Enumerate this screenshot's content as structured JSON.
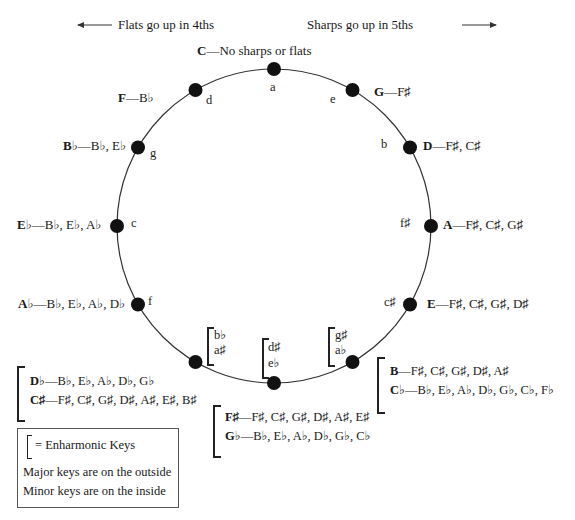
{
  "header": {
    "flats_direction": "Flats go up in 4ths",
    "sharps_direction": "Sharps go up in 5ths"
  },
  "circle": {
    "center": [
      274,
      226
    ],
    "radius": 157,
    "dot_color": "#111111",
    "line_color": "#333333"
  },
  "keys": [
    {
      "angle": 0,
      "major": "C",
      "signature": "No sharps or flats",
      "minor": "a"
    },
    {
      "angle": 30,
      "major": "G",
      "signature": "F♯",
      "minor": "e"
    },
    {
      "angle": 60,
      "major": "D",
      "signature": "F♯, C♯",
      "minor": "b"
    },
    {
      "angle": 90,
      "major": "A",
      "signature": "F♯, C♯, G♯",
      "minor": "f♯"
    },
    {
      "angle": 120,
      "major": "E",
      "signature": "F♯, C♯, G♯, D♯",
      "minor": "c♯"
    },
    {
      "angle": 270,
      "major": "E♭",
      "signature": "B♭, E♭, A♭",
      "minor": "c"
    },
    {
      "angle": 240,
      "major": "A♭",
      "signature": "B♭, E♭, A♭, D♭",
      "minor": "f"
    },
    {
      "angle": 300,
      "major": "B♭",
      "signature": "B♭, E♭",
      "minor": "g"
    },
    {
      "angle": 330,
      "major": "F",
      "signature": "B♭",
      "minor": "d"
    }
  ],
  "enharmonic_groups": [
    {
      "angle": 150,
      "minors": [
        "g♯",
        "a♭"
      ],
      "majors": [
        {
          "major": "B",
          "signature": "F♯, C♯, G♯, D♯, A♯"
        },
        {
          "major": "C♭",
          "signature": "B♭, E♭, A♭, D♭, G♭, C♭, F♭"
        }
      ]
    },
    {
      "angle": 180,
      "minors": [
        "d♯",
        "e♭"
      ],
      "majors": [
        {
          "major": "F♯",
          "signature": "F♯, C♯, G♯, D♯, A♯, E♯"
        },
        {
          "major": "G♭",
          "signature": "B♭, E♭, A♭, D♭, G♭, C♭"
        }
      ]
    },
    {
      "angle": 210,
      "minors": [
        "b♭",
        "a♯"
      ],
      "majors": [
        {
          "major": "D♭",
          "signature": "B♭, E♭, A♭, D♭, G♭"
        },
        {
          "major": "C♯",
          "signature": "F♯, C♯, G♯, D♯, A♯, E♯, B♯"
        }
      ]
    }
  ],
  "separator": "—",
  "legend": {
    "bracket_meaning": "= Enharmonic Keys",
    "line1": "Major keys are on the outside",
    "line2": "Minor keys are on the inside"
  }
}
